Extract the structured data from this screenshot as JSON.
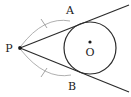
{
  "figure": {
    "background_color": "#ffffff",
    "width": 131,
    "height": 97,
    "stroke_color": "#2b2b2b",
    "arc_color": "#9a9a9a",
    "tick_color": "#9a9a9a"
  },
  "labels": {
    "point_p": "P",
    "point_a": "A",
    "point_b": "B",
    "center_o": "O"
  },
  "geometry": {
    "circle": {
      "center_x": 90,
      "center_y": 48,
      "radius": 26
    },
    "external_point": {
      "x": 20,
      "y": 48
    },
    "tangent_point_a": {
      "x": 70,
      "y": 22
    },
    "tangent_point_b": {
      "x": 71,
      "y": 74
    },
    "center_dot": {
      "x": 90,
      "y": 42
    },
    "tangent_line_upper": "M 20 48 L 129 5",
    "tangent_line_lower": "M 20 48 L 129 92",
    "congruence_arc_upper": "M 21 46 Q 44 16 70 21",
    "congruence_arc_lower": "M 21 50 Q 45 80 71 75",
    "tick_upper": "M 41 19 L 47 28",
    "tick_lower": "M 41 77 L 47 68"
  },
  "annotations": {
    "tick_count_upper": 1,
    "tick_count_lower": 1,
    "equal_segments": "PA = PB"
  }
}
